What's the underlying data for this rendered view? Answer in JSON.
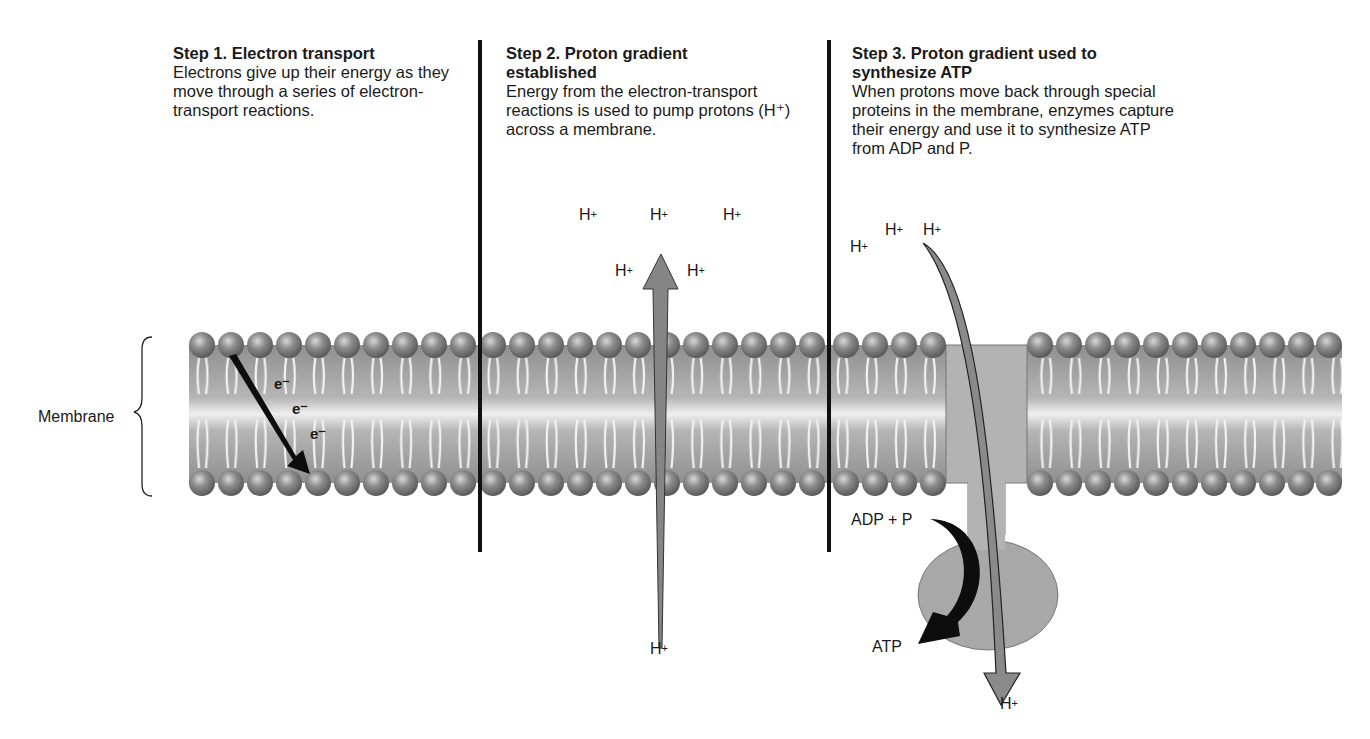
{
  "steps": [
    {
      "title": "Step 1. Electron transport",
      "body": "Electrons give up their energy as they move through a series of electron-transport reactions."
    },
    {
      "title": "Step 2. Proton gradient established",
      "body": "Energy from the electron-transport reactions is used to pump protons (H⁺) across a membrane."
    },
    {
      "title": "Step 3. Proton gradient used to synthesize ATP",
      "body": "When protons move back through special proteins in the membrane, enzymes capture their energy and use it to synthesize ATP from ADP and P."
    }
  ],
  "labels": {
    "membrane": "Membrane",
    "electron": "e⁻",
    "proton": "H",
    "proton_charge": "+",
    "adp_p": "ADP + P",
    "atp": "ATP"
  },
  "colors": {
    "head": "#7a7a7a",
    "membrane_band": "#9a9a9a",
    "protein": "#b5b5b5",
    "arrow_gray": "#8a8a8a",
    "black": "#111111"
  }
}
